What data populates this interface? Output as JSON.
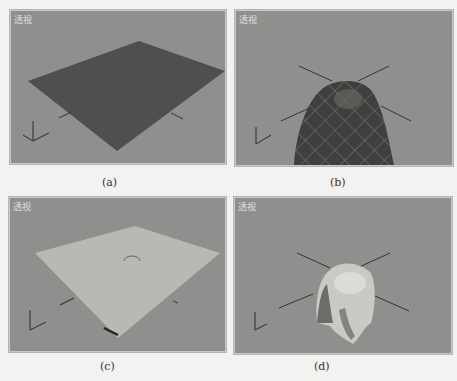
{
  "figure": {
    "panels": [
      {
        "id": "a",
        "viewport_label": "透视",
        "caption": "(a)",
        "object": "dark flat plane"
      },
      {
        "id": "b",
        "viewport_label": "透视",
        "caption": "(b)",
        "object": "draped cloth with mesh grid (dark)"
      },
      {
        "id": "c",
        "viewport_label": "透视",
        "caption": "(c)",
        "object": "light flat plane"
      },
      {
        "id": "d",
        "viewport_label": "透视",
        "caption": "(d)",
        "object": "draped cloth (light)"
      }
    ],
    "colors": {
      "page_bg": "#f2f2f0",
      "viewport_bg": "#8f8f8d",
      "dark_plane": "#4d4d4b",
      "light_plane": "#b8b8b4",
      "axis_line": "#3a3a3a"
    }
  }
}
